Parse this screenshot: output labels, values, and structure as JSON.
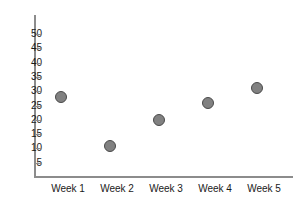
{
  "chart_data": {
    "type": "scatter",
    "title": "",
    "subtitle": "",
    "xlabel": "",
    "ylabel": "",
    "categories": [
      "Week 1",
      "Week 2",
      "Week 3",
      "Week 4",
      "Week 5"
    ],
    "values": [
      28,
      11,
      20,
      26,
      31
    ],
    "series": [
      {
        "name": "",
        "values": [
          28,
          11,
          20,
          26,
          31
        ]
      }
    ],
    "points": [
      {
        "category": "Week 1",
        "value": 28
      },
      {
        "category": "Week 2",
        "value": 11
      },
      {
        "category": "Week 3",
        "value": 20
      },
      {
        "category": "Week 4",
        "value": 26
      },
      {
        "category": "Week 5",
        "value": 31
      }
    ],
    "ylim": [
      0,
      52
    ],
    "yticks": [
      5,
      10,
      15,
      20,
      25,
      30,
      35,
      40,
      45,
      50
    ],
    "ytick_labels": [
      "5",
      "10",
      "15",
      "20",
      "25",
      "30",
      "35",
      "40",
      "45",
      "50"
    ],
    "grid": false,
    "legend": false,
    "legend_position": "none",
    "marker": {
      "shape": "circle",
      "fill_color": "#818181",
      "edge_color": "#4a4a4a"
    },
    "axis_color": "#8c8c8c",
    "background_color": "#ffffff",
    "text_color": "#1a1a1a"
  }
}
